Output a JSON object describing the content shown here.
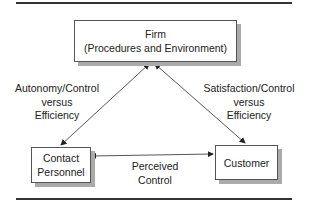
{
  "diagram": {
    "nodes": {
      "firm": {
        "line1": "Firm",
        "line2": "(Procedures and Environment)"
      },
      "contact": {
        "line1": "Contact",
        "line2": "Personnel"
      },
      "customer": {
        "line1": "Customer"
      }
    },
    "edges": {
      "firm_contact": {
        "line1": "Autonomy/Control",
        "line2": "versus",
        "line3": "Efficiency"
      },
      "firm_customer": {
        "line1": "Satisfaction/Control",
        "line2": "versus",
        "line3": "Efficiency"
      },
      "contact_customer": {
        "line1": "Perceived",
        "line2": "Control"
      }
    },
    "colors": {
      "line": "#333333",
      "shadow": "#aaaaaa"
    }
  }
}
